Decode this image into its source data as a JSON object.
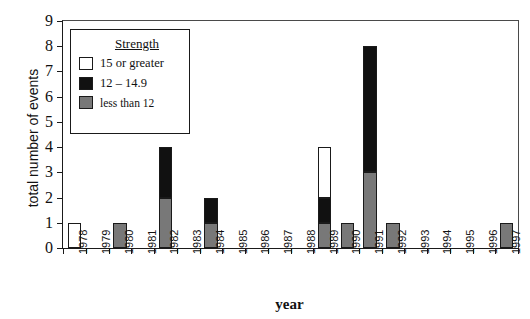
{
  "chart_data": {
    "type": "bar",
    "title": "",
    "xlabel": "year",
    "ylabel": "total number of events",
    "stacked": true,
    "grid": false,
    "ylim": [
      0,
      9
    ],
    "yticks": [
      0,
      1,
      2,
      3,
      4,
      5,
      6,
      7,
      8,
      9
    ],
    "legend_position": "upper-left",
    "legend_title": "Strength",
    "categories": [
      "1978",
      "1979",
      "1980",
      "1981",
      "1982",
      "1983",
      "1984",
      "1985",
      "1986",
      "1987",
      "1988",
      "1989",
      "1990",
      "1991",
      "1992",
      "1993",
      "1994",
      "1995",
      "1996",
      "1997"
    ],
    "series": [
      {
        "name": "less than 12",
        "color": "#787878",
        "values": [
          0,
          0,
          1,
          0,
          2,
          0,
          1,
          0,
          0,
          0,
          0,
          1,
          1,
          3,
          1,
          0,
          0,
          0,
          0,
          1
        ]
      },
      {
        "name": "12 – 14.9",
        "color": "#111111",
        "values": [
          0,
          0,
          0,
          0,
          2,
          0,
          1,
          0,
          0,
          0,
          0,
          1,
          0,
          5,
          0,
          0,
          0,
          0,
          0,
          0
        ]
      },
      {
        "name": "15 or greater",
        "color": "#ffffff",
        "values": [
          1,
          0,
          0,
          0,
          0,
          0,
          0,
          0,
          0,
          0,
          0,
          2,
          0,
          0,
          0,
          0,
          0,
          0,
          0,
          0
        ]
      }
    ],
    "totals": [
      1,
      0,
      1,
      0,
      4,
      0,
      2,
      0,
      0,
      0,
      0,
      4,
      1,
      8,
      1,
      0,
      0,
      0,
      0,
      1
    ]
  },
  "legend": {
    "title": "Strength",
    "entries": [
      {
        "label": "15 or greater",
        "swatch": "white"
      },
      {
        "label": "12 – 14.9",
        "swatch": "black"
      },
      {
        "label": "less than 12",
        "swatch": "gray"
      }
    ]
  },
  "axes": {
    "x_title": "year",
    "y_title": "total number of events"
  }
}
